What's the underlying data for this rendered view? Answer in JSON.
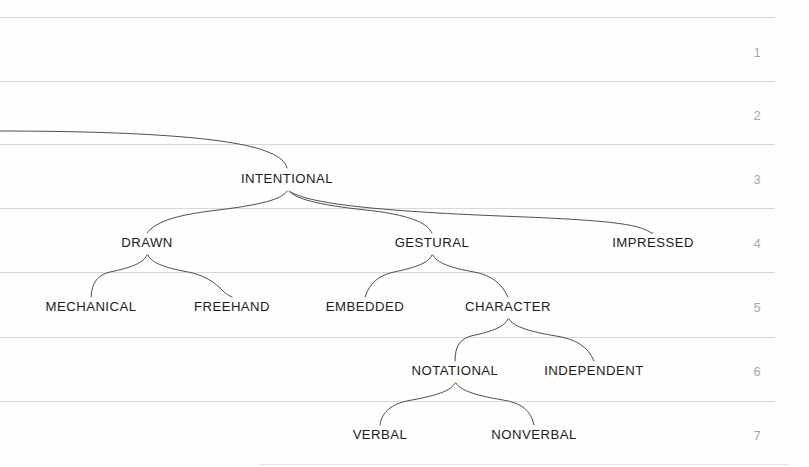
{
  "figure": {
    "type": "hierarchical-tree-diagram",
    "background_color": "#fefefe",
    "label_color": "#1c1c1c",
    "branch_color": "#3a3a3a",
    "gridline_color": "#d8d8d8",
    "row_number_color": "#a9a9a9"
  },
  "row_numbers": [
    {
      "label": "1",
      "x": 757,
      "y": 57
    },
    {
      "label": "2",
      "x": 757,
      "y": 120
    },
    {
      "label": "3",
      "x": 757,
      "y": 184
    },
    {
      "label": "4",
      "x": 757,
      "y": 248
    },
    {
      "label": "5",
      "x": 757,
      "y": 312
    },
    {
      "label": "6",
      "x": 757,
      "y": 376
    },
    {
      "label": "7",
      "x": 757,
      "y": 440
    }
  ],
  "gridlines": [
    {
      "y": 17,
      "x1": 0,
      "x2": 775,
      "faint": false
    },
    {
      "y": 81,
      "x1": 0,
      "x2": 775,
      "faint": false
    },
    {
      "y": 144,
      "x1": 0,
      "x2": 775,
      "faint": false
    },
    {
      "y": 208,
      "x1": 0,
      "x2": 775,
      "faint": false
    },
    {
      "y": 272,
      "x1": 0,
      "x2": 775,
      "faint": false
    },
    {
      "y": 337,
      "x1": 0,
      "x2": 775,
      "faint": false
    },
    {
      "y": 401,
      "x1": 0,
      "x2": 775,
      "faint": false
    },
    {
      "y": 464,
      "x1": 258,
      "x2": 790,
      "faint": true
    }
  ],
  "nodes": [
    {
      "id": "intentional",
      "label": "INTENTIONAL",
      "x": 287,
      "y": 183,
      "level": 3
    },
    {
      "id": "drawn",
      "label": "DRAWN",
      "x": 147,
      "y": 247,
      "level": 4
    },
    {
      "id": "gestural",
      "label": "GESTURAL",
      "x": 432,
      "y": 247,
      "level": 4
    },
    {
      "id": "impressed",
      "label": "IMPRESSED",
      "x": 653,
      "y": 247,
      "level": 4
    },
    {
      "id": "mechanical",
      "label": "MECHANICAL",
      "x": 91,
      "y": 311,
      "level": 5
    },
    {
      "id": "freehand",
      "label": "FREEHAND",
      "x": 232,
      "y": 311,
      "level": 5
    },
    {
      "id": "embedded",
      "label": "EMBEDDED",
      "x": 365,
      "y": 311,
      "level": 5
    },
    {
      "id": "character",
      "label": "CHARACTER",
      "x": 508,
      "y": 311,
      "level": 5
    },
    {
      "id": "notational",
      "label": "NOTATIONAL",
      "x": 455,
      "y": 375,
      "level": 6
    },
    {
      "id": "independent",
      "label": "INDEPENDENT",
      "x": 594,
      "y": 375,
      "level": 6
    },
    {
      "id": "verbal",
      "label": "VERBAL",
      "x": 380,
      "y": 439,
      "level": 7
    },
    {
      "id": "nonverbal",
      "label": "NONVERBAL",
      "x": 534,
      "y": 439,
      "level": 7
    }
  ],
  "edges": [
    {
      "id": "edge-root-intentional",
      "from": "root-offscreen",
      "to": "intentional",
      "path": "M -5 131 C 120 131, 230 136, 268 152 C 281 157, 286 163, 287 168"
    },
    {
      "id": "edge-intentional-drawn",
      "from": "intentional",
      "to": "drawn",
      "path": "M 287 191 C 283 199, 262 205, 210 211 C 180 215, 162 220, 152 228 C 148 231, 147 234, 147 233"
    },
    {
      "id": "edge-intentional-gestural",
      "from": "intentional",
      "to": "gestural",
      "path": "M 289 191 C 296 200, 325 206, 375 211 C 404 215, 424 221, 430 230 C 432 233, 432 234, 432 233"
    },
    {
      "id": "edge-intentional-impressed",
      "from": "intentional",
      "to": "impressed",
      "path": "M 291 192 C 310 204, 380 211, 500 216 C 580 219, 630 222, 646 230 C 652 233, 653 234, 653 233"
    },
    {
      "id": "edge-drawn-mechanical",
      "from": "drawn",
      "to": "mechanical",
      "path": "M 147 255 C 144 263, 130 268, 110 272 C 98 275, 92 282, 91 297"
    },
    {
      "id": "edge-drawn-freehand",
      "from": "drawn",
      "to": "freehand",
      "path": "M 148 255 C 151 263, 166 268, 188 272 C 203 275, 214 281, 224 292 C 229 296, 232 297, 232 297"
    },
    {
      "id": "edge-gestural-embedded",
      "from": "gestural",
      "to": "embedded",
      "path": "M 432 255 C 429 263, 414 268, 394 272 C 380 275, 370 282, 365 297"
    },
    {
      "id": "edge-gestural-character",
      "from": "gestural",
      "to": "character",
      "path": "M 433 255 C 436 263, 452 268, 474 272 C 490 275, 501 282, 508 297"
    },
    {
      "id": "edge-character-notational",
      "from": "character",
      "to": "notational",
      "path": "M 508 319 C 505 327, 490 332, 471 336 C 460 339, 455 346, 455 361"
    },
    {
      "id": "edge-character-independent",
      "from": "character",
      "to": "independent",
      "path": "M 509 319 C 513 327, 532 332, 556 336 C 575 339, 588 346, 594 361"
    },
    {
      "id": "edge-notational-verbal",
      "from": "notational",
      "to": "verbal",
      "path": "M 455 383 C 452 391, 434 396, 412 400 C 394 403, 382 410, 380 425"
    },
    {
      "id": "edge-notational-nonverbal",
      "from": "notational",
      "to": "nonverbal",
      "path": "M 456 383 C 460 391, 479 396, 503 400 C 521 403, 531 410, 534 425"
    }
  ]
}
